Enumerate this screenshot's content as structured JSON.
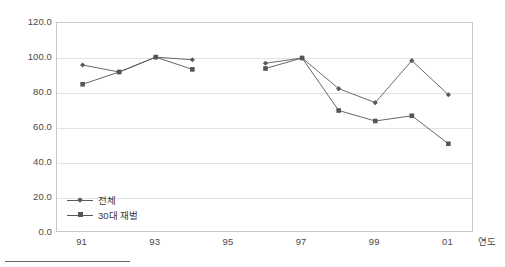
{
  "chart_data": {
    "type": "line",
    "title": "",
    "subtitle": "",
    "xlabel": "연도",
    "ylabel": "",
    "x": [
      91,
      92,
      93,
      94,
      95,
      96,
      97,
      98,
      99,
      100,
      101
    ],
    "categories": [
      "91",
      "92",
      "93",
      "94",
      "95",
      "96",
      "97",
      "98",
      "99",
      "00",
      "01"
    ],
    "xtick_labels": [
      "91",
      "93",
      "95",
      "97",
      "99",
      "01"
    ],
    "xtick_values": [
      91,
      93,
      95,
      97,
      99,
      101
    ],
    "ytick_labels": [
      "0.0",
      "20.0",
      "40.0",
      "60.0",
      "80.0",
      "100.0",
      "120.0"
    ],
    "ytick_values": [
      0,
      20,
      40,
      60,
      80,
      100,
      120
    ],
    "ylim": [
      0,
      120
    ],
    "xlim": [
      90.3,
      101.7
    ],
    "grid": true,
    "grid_axis": "y",
    "legend_position": "lower-left-inside",
    "series": [
      {
        "name": "전체",
        "marker": "diamond",
        "color": "#595959",
        "values": [
          96,
          92,
          100.5,
          99,
          null,
          97,
          100,
          82.5,
          74.5,
          98.5,
          79
        ]
      },
      {
        "name": "30대 재벌",
        "marker": "square",
        "color": "#555555",
        "values": [
          85,
          92,
          100.5,
          93.5,
          null,
          94,
          100,
          70,
          64,
          67,
          51
        ]
      }
    ]
  },
  "footer": {
    "rule": ""
  }
}
